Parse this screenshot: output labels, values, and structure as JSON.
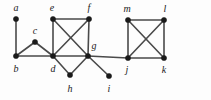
{
  "figure": {
    "background_color": "#fdfdfd",
    "edge_color": "#4a4a4a",
    "vertex_color": "#1a1a1a",
    "width": 211,
    "height": 100
  },
  "chart_data": {
    "type": "diagram",
    "subtype": "node-link-graph",
    "title": "",
    "directed": false,
    "weighted": false,
    "node_count": 13,
    "edge_count": 20,
    "nodes": [
      {
        "id": "a",
        "label": "a",
        "x": 16,
        "y": 19,
        "label_x": 16,
        "label_y": 8
      },
      {
        "id": "b",
        "label": "b",
        "x": 16,
        "y": 56,
        "label_x": 16,
        "label_y": 69
      },
      {
        "id": "c",
        "label": "c",
        "x": 35,
        "y": 42,
        "label_x": 35,
        "label_y": 31
      },
      {
        "id": "d",
        "label": "d",
        "x": 53,
        "y": 56,
        "label_x": 53,
        "label_y": 69
      },
      {
        "id": "e",
        "label": "e",
        "x": 53,
        "y": 19,
        "label_x": 52,
        "label_y": 8
      },
      {
        "id": "f",
        "label": "f",
        "x": 89,
        "y": 19,
        "label_x": 89,
        "label_y": 8
      },
      {
        "id": "g",
        "label": "g",
        "x": 88,
        "y": 56,
        "label_x": 94,
        "label_y": 46
      },
      {
        "id": "h",
        "label": "h",
        "x": 70,
        "y": 75,
        "label_x": 70,
        "label_y": 89
      },
      {
        "id": "i",
        "label": "i",
        "x": 109,
        "y": 76,
        "label_x": 109,
        "label_y": 89
      },
      {
        "id": "j",
        "label": "j",
        "x": 128,
        "y": 58,
        "label_x": 127,
        "label_y": 70
      },
      {
        "id": "k",
        "label": "k",
        "x": 164,
        "y": 58,
        "label_x": 164,
        "label_y": 70
      },
      {
        "id": "l",
        "label": "l",
        "x": 164,
        "y": 20,
        "label_x": 165,
        "label_y": 9
      },
      {
        "id": "m",
        "label": "m",
        "x": 128,
        "y": 20,
        "label_x": 127,
        "label_y": 9
      }
    ],
    "edges": [
      {
        "source": "a",
        "target": "b"
      },
      {
        "source": "b",
        "target": "c"
      },
      {
        "source": "c",
        "target": "d"
      },
      {
        "source": "b",
        "target": "d"
      },
      {
        "source": "e",
        "target": "f"
      },
      {
        "source": "e",
        "target": "d"
      },
      {
        "source": "e",
        "target": "g"
      },
      {
        "source": "f",
        "target": "d"
      },
      {
        "source": "f",
        "target": "g"
      },
      {
        "source": "d",
        "target": "g"
      },
      {
        "source": "d",
        "target": "h"
      },
      {
        "source": "g",
        "target": "h"
      },
      {
        "source": "g",
        "target": "i"
      },
      {
        "source": "g",
        "target": "j"
      },
      {
        "source": "m",
        "target": "l"
      },
      {
        "source": "m",
        "target": "j"
      },
      {
        "source": "m",
        "target": "k"
      },
      {
        "source": "l",
        "target": "j"
      },
      {
        "source": "l",
        "target": "k"
      },
      {
        "source": "j",
        "target": "k"
      }
    ],
    "vertex_radius": 2.6
  }
}
